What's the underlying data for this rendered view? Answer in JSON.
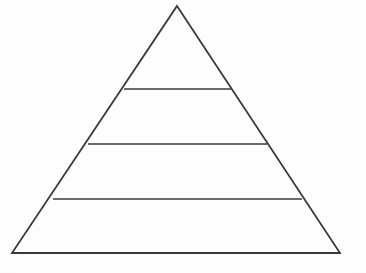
{
  "figure": {
    "kind": "pyramid-diagram",
    "background_color": "#fdfdfd",
    "stroke_color": "#3a3a3a",
    "stroke_width": 1.8,
    "fill_color": "none",
    "canvas": {
      "width": 366,
      "height": 273
    }
  },
  "chart_data": {
    "type": "pyramid",
    "title": "",
    "subtitle": "",
    "xlabel": "",
    "ylabel": "",
    "grid": false,
    "legend": null,
    "annotations": [],
    "outline": {
      "apex": {
        "x": 177,
        "y": 6
      },
      "bottom_left": {
        "x": 12,
        "y": 253
      },
      "bottom_right": {
        "x": 340,
        "y": 253
      }
    },
    "divider_count": 3,
    "dividers": [
      {
        "index": 1,
        "y": 89,
        "x_left": 124,
        "x_right": 232,
        "width": 108
      },
      {
        "index": 2,
        "y": 144,
        "x_left": 88,
        "x_right": 267,
        "width": 179
      },
      {
        "index": 3,
        "y": 199,
        "x_left": 53,
        "x_right": 302,
        "width": 249
      }
    ],
    "tiers": [
      {
        "index": 1,
        "position": "top",
        "label": "",
        "value": null,
        "y_top": 6,
        "y_bottom": 89
      },
      {
        "index": 2,
        "position": "upper-middle",
        "label": "",
        "value": null,
        "y_top": 89,
        "y_bottom": 144
      },
      {
        "index": 3,
        "position": "lower-middle",
        "label": "",
        "value": null,
        "y_top": 144,
        "y_bottom": 199
      },
      {
        "index": 4,
        "position": "base",
        "label": "",
        "value": null,
        "y_top": 199,
        "y_bottom": 253
      }
    ]
  }
}
